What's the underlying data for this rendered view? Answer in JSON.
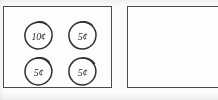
{
  "worksheet": {
    "background_color": "#fbfbfa",
    "ink_color": "#2b2b2b",
    "border_color": "#4a4a4a"
  },
  "groups": [
    {
      "id": "left-coin-group",
      "name": "left-coin-box",
      "clipped": false,
      "total_label": "",
      "coins": [
        {
          "value": "10¢",
          "denomination": "dime",
          "row": 1,
          "col": 1,
          "clipped": false
        },
        {
          "value": "5¢",
          "denomination": "nickel",
          "row": 1,
          "col": 2,
          "clipped": false
        },
        {
          "value": "5¢",
          "denomination": "nickel",
          "row": 2,
          "col": 1,
          "clipped": false
        },
        {
          "value": "5¢",
          "denomination": "nickel",
          "row": 2,
          "col": 2,
          "clipped": false
        }
      ]
    },
    {
      "id": "right-coin-group",
      "name": "right-coin-box",
      "clipped": true,
      "total_label": "",
      "coins": [
        {
          "value": "10¢",
          "denomination": "dime",
          "row": 1,
          "col": 1,
          "clipped": false
        },
        {
          "value": "5¢",
          "denomination": "nickel",
          "row": 1,
          "col": 2,
          "clipped": false
        },
        {
          "value": "1¢",
          "denomination": "penny",
          "row": 2,
          "col": 1,
          "clipped": false
        },
        {
          "value": "1¢",
          "denomination": "penny",
          "row": 2,
          "col": 2,
          "clipped": false
        },
        {
          "value": "1¢",
          "denomination": "penny",
          "row": 2,
          "col": 3,
          "clipped": true
        }
      ]
    }
  ]
}
